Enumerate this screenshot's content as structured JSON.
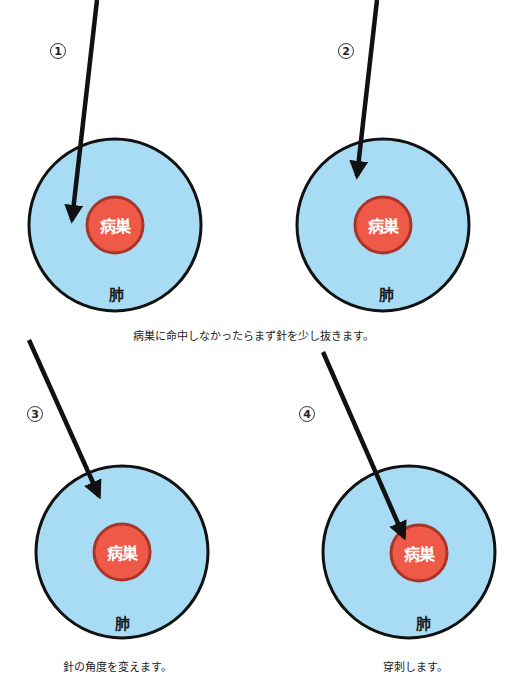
{
  "colors": {
    "lung_fill": "#a8dcf4",
    "lung_stroke": "#111111",
    "lesion_fill": "#ef5a48",
    "lesion_stroke": "#a8352a",
    "needle": "#111111"
  },
  "panels": [
    {
      "step": "1",
      "lesion_label": "病巣",
      "lung_label": "肺"
    },
    {
      "step": "2",
      "lesion_label": "病巣",
      "lung_label": "肺"
    },
    {
      "step": "3",
      "lesion_label": "病巣",
      "lung_label": "肺"
    },
    {
      "step": "4",
      "lesion_label": "病巣",
      "lung_label": "肺"
    }
  ],
  "captions": {
    "middle": "病巣に命中しなかったらまず針を少し抜きます。",
    "step3": "針の角度を変えます。",
    "step4": "穿刺します。"
  }
}
